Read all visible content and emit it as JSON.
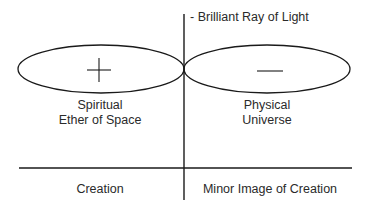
{
  "diagram": {
    "ray_label": "- Brilliant Ray of Light",
    "left_ellipse": {
      "symbol": "+",
      "label_line1": "Spiritual",
      "label_line2": "Ether of Space"
    },
    "right_ellipse": {
      "symbol": "—",
      "label_line1": "Physical",
      "label_line2": "Universe"
    },
    "bottom_left_label": "Creation",
    "bottom_right_label": "Minor Image of Creation",
    "colors": {
      "line": "#1a1a1a",
      "text": "#2a2a2a",
      "background": "#ffffff"
    }
  }
}
